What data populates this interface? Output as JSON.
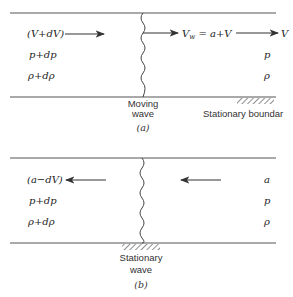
{
  "panels": {
    "a": {
      "caption": "(a)",
      "left_labels": {
        "velocity": "(V+dV)",
        "pressure": "p+dp",
        "density": "ρ+dρ"
      },
      "right_labels": {
        "velocity": "V",
        "pressure": "p",
        "density": "ρ"
      },
      "wave_velocity_label": "V",
      "wave_velocity_sub": "w",
      "wave_velocity_rhs": " = a+V",
      "wave_label_line1": "Moving",
      "wave_label_line2": "wave",
      "boundary_label": "Stationary boundar"
    },
    "b": {
      "caption": "(b)",
      "left_labels": {
        "velocity": "(a−dV)",
        "pressure": "p+dp",
        "density": "ρ+dρ"
      },
      "right_labels": {
        "velocity": "a",
        "pressure": "p",
        "density": "ρ"
      },
      "wave_label_line1": "Stationary",
      "wave_label_line2": "wave"
    }
  },
  "colors": {
    "line": "#555555",
    "text": "#222222"
  }
}
